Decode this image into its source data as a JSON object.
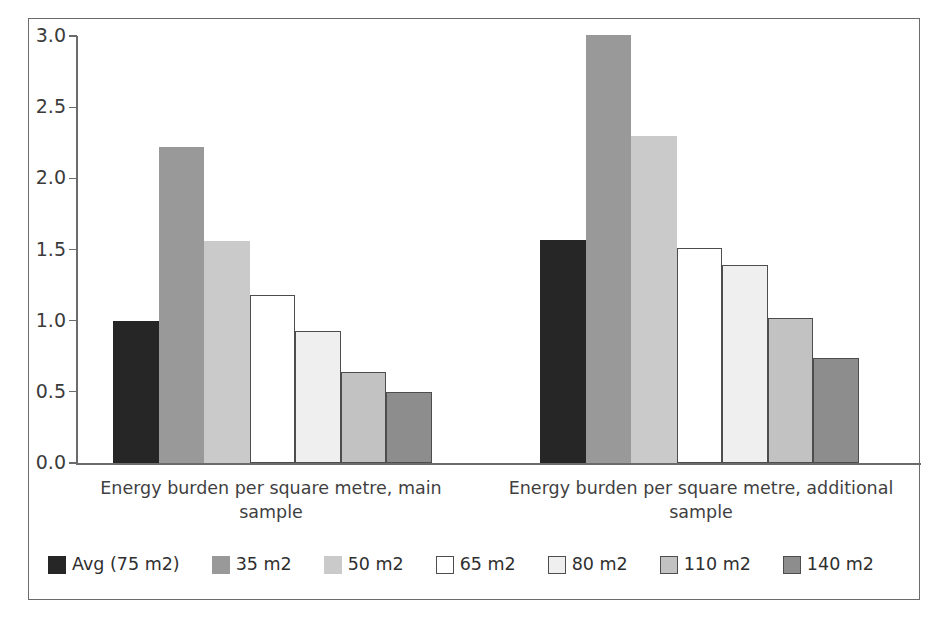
{
  "chart_data": {
    "type": "bar",
    "title": "",
    "subtitle": "",
    "xlabel": "",
    "ylabel": "",
    "ylim": [
      0.0,
      3.0
    ],
    "grid": false,
    "legend_position": "bottom",
    "ytick_labels": [
      "0.0",
      "0.5",
      "1.0",
      "1.5",
      "2.0",
      "2.5",
      "3.0"
    ],
    "ytick_values": [
      0.0,
      0.5,
      1.0,
      1.5,
      2.0,
      2.5,
      3.0
    ],
    "categories": [
      "Energy burden per square metre, main sample",
      "Energy burden per square metre, additional sample"
    ],
    "series": [
      {
        "name": "Avg (75 m2)",
        "color": "#262626",
        "border": "#262626",
        "values": [
          1.0,
          1.57
        ]
      },
      {
        "name": "35 m2",
        "color": "#999999",
        "border": "#999999",
        "values": [
          2.22,
          3.01
        ]
      },
      {
        "name": "50 m2",
        "color": "#cacaca",
        "border": "#cacaca",
        "values": [
          1.56,
          2.3
        ]
      },
      {
        "name": "65 m2",
        "color": "#ffffff",
        "border": "#4d4d4d",
        "values": [
          1.18,
          1.51
        ]
      },
      {
        "name": "80 m2",
        "color": "#efefef",
        "border": "#4d4d4d",
        "values": [
          0.93,
          1.39
        ]
      },
      {
        "name": "110 m2",
        "color": "#c2c2c2",
        "border": "#4d4d4d",
        "values": [
          0.64,
          1.02
        ]
      },
      {
        "name": "140 m2",
        "color": "#8d8d8d",
        "border": "#4d4d4d",
        "values": [
          0.5,
          0.74
        ]
      }
    ]
  },
  "legend": {
    "items": [
      {
        "label": "Avg (75 m2)"
      },
      {
        "label": "35 m2"
      },
      {
        "label": "50 m2"
      },
      {
        "label": "65 m2"
      },
      {
        "label": "80 m2"
      },
      {
        "label": "110 m2"
      },
      {
        "label": "140 m2"
      }
    ]
  }
}
